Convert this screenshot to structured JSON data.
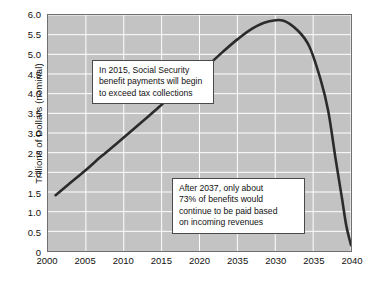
{
  "chart_data": {
    "type": "line",
    "title": "",
    "xlabel": "",
    "ylabel": "Trillions of Dollars (nominal)",
    "xlim": [
      2000,
      2040
    ],
    "ylim": [
      0,
      6.0
    ],
    "grid": true,
    "legend": null,
    "x_ticks": [
      "2000",
      "2005",
      "2010",
      "2015",
      "2020",
      "2035",
      "2030",
      "2035",
      "2040"
    ],
    "x_tick_values": [
      2000,
      2005,
      2010,
      2015,
      2020,
      2025,
      2030,
      2035,
      2040
    ],
    "y_ticks": [
      "0",
      "0.5",
      "1.0",
      "1.5",
      "2.0",
      "2.5",
      "3.0",
      "3.5",
      "4.0",
      "4.5",
      "5.0",
      "5.5",
      "6.0"
    ],
    "y_tick_values": [
      0,
      0.5,
      1.0,
      1.5,
      2.0,
      2.5,
      3.0,
      3.5,
      4.0,
      4.5,
      5.0,
      5.5,
      6.0
    ],
    "series": [
      {
        "name": "Social Security trust fund balance",
        "color": "#2b2b2b",
        "x": [
          2001,
          2003,
          2005,
          2007,
          2009,
          2011,
          2013,
          2015,
          2017,
          2019,
          2021,
          2023,
          2025,
          2027,
          2029,
          2031,
          2033,
          2034.5,
          2036,
          2037,
          2038,
          2038.8,
          2039.4,
          2040
        ],
        "y": [
          1.42,
          1.74,
          2.06,
          2.4,
          2.72,
          3.05,
          3.38,
          3.72,
          4.05,
          4.38,
          4.7,
          5.05,
          5.38,
          5.66,
          5.83,
          5.86,
          5.6,
          5.2,
          4.35,
          3.55,
          2.3,
          1.35,
          0.62,
          0.15
        ]
      }
    ],
    "annotations": [
      {
        "id": "annotation-2015",
        "lines": [
          "In 2015, Social Security",
          "benefit payments will begin",
          "to exceed tax collections"
        ]
      },
      {
        "id": "annotation-2037",
        "lines": [
          "After 2037, only about",
          "73% of benefits would",
          "continue to be paid based",
          "on incoming revenues"
        ]
      }
    ],
    "colors": {
      "plot_background": "#c3c3c3",
      "gridline": "#ffffff",
      "axis_border": "#6f6f6f",
      "series_line": "#2b2b2b",
      "page_background": "#ffffff",
      "text": "#111111"
    }
  }
}
